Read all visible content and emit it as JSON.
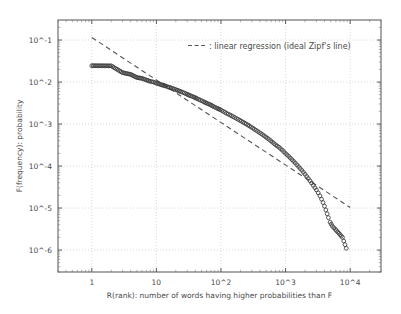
{
  "chart_data": {
    "type": "scatter",
    "title": "",
    "xlabel": "R(rank): number of words having higher probabilities than F",
    "ylabel": "F(frequency): probability",
    "xscale": "log",
    "yscale": "log",
    "xlim": [
      0.3,
      30000
    ],
    "ylim": [
      3e-07,
      0.3
    ],
    "grid": true,
    "legend_position": "top-right",
    "legend": [
      {
        "label": ": linear regression (ideal Zipf's line)",
        "style": "dashed",
        "color": "#555555"
      }
    ],
    "xticks": [
      1,
      10,
      100,
      1000,
      10000
    ],
    "xtick_labels": [
      "1",
      "10",
      "10^2",
      "10^3",
      "10^4"
    ],
    "yticks": [
      0.1,
      0.01,
      0.001,
      0.0001,
      1e-05,
      1e-06
    ],
    "ytick_labels": [
      "10^-1",
      "10^-2",
      "10^-3",
      "10^-4",
      "10^-5",
      "10^-6"
    ],
    "series": [
      {
        "name": "observed word frequencies",
        "marker": "open-circle",
        "color": "#3a3a3a",
        "points": [
          [
            1,
            0.0245
          ],
          [
            2,
            0.0243
          ],
          [
            3,
            0.0167
          ],
          [
            4,
            0.0152
          ],
          [
            5,
            0.0128
          ],
          [
            6,
            0.0122
          ],
          [
            7,
            0.0112
          ],
          [
            8,
            0.0104
          ],
          [
            9,
            0.01
          ],
          [
            10,
            0.0094
          ],
          [
            11,
            0.009
          ],
          [
            12,
            0.0086
          ],
          [
            13,
            0.0083
          ],
          [
            14,
            0.008
          ],
          [
            15,
            0.0077
          ],
          [
            17,
            0.0072
          ],
          [
            19,
            0.0068
          ],
          [
            21,
            0.0064
          ],
          [
            24,
            0.0059
          ],
          [
            27,
            0.0055
          ],
          [
            30,
            0.0051
          ],
          [
            34,
            0.0047
          ],
          [
            38,
            0.0044
          ],
          [
            43,
            0.004
          ],
          [
            48,
            0.0037
          ],
          [
            54,
            0.0034
          ],
          [
            61,
            0.0031
          ],
          [
            68,
            0.0029
          ],
          [
            77,
            0.0026
          ],
          [
            86,
            0.0024
          ],
          [
            97,
            0.0022
          ],
          [
            109,
            0.002
          ],
          [
            122,
            0.0018
          ],
          [
            137,
            0.00165
          ],
          [
            154,
            0.0015
          ],
          [
            173,
            0.00136
          ],
          [
            195,
            0.00123
          ],
          [
            219,
            0.00111
          ],
          [
            246,
            0.001
          ],
          [
            276,
            0.0009
          ],
          [
            310,
            0.0008
          ],
          [
            349,
            0.00071
          ],
          [
            392,
            0.00063
          ],
          [
            440,
            0.00056
          ],
          [
            495,
            0.00049
          ],
          [
            556,
            0.00043
          ],
          [
            625,
            0.00037
          ],
          [
            702,
            0.00032
          ],
          [
            789,
            0.00028
          ],
          [
            886,
            0.00024
          ],
          [
            996,
            0.0002
          ],
          [
            1119,
            0.00017
          ],
          [
            1257,
            0.000142
          ],
          [
            1412,
            0.000118
          ],
          [
            1587,
            9.7e-05
          ],
          [
            1783,
            7.9e-05
          ],
          [
            2003,
            6.35e-05
          ],
          [
            2250,
            5.05e-05
          ],
          [
            2528,
            3.95e-05
          ],
          [
            2840,
            3.05e-05
          ],
          [
            3000,
            2.7e-05
          ],
          [
            3200,
            2.3e-05
          ],
          [
            3400,
            1.95e-05
          ],
          [
            3600,
            1.63e-05
          ],
          [
            3800,
            1.35e-05
          ],
          [
            4000,
            1.11e-05
          ],
          [
            4200,
            9e-06
          ],
          [
            4400,
            7.3e-06
          ],
          [
            4600,
            5.9e-06
          ],
          [
            4900,
            4.6e-06
          ],
          [
            5300,
            3.7e-06
          ],
          [
            5900,
            3.1e-06
          ],
          [
            6700,
            2.5e-06
          ],
          [
            7600,
            2e-06
          ],
          [
            8700,
            1.1e-06
          ]
        ]
      }
    ],
    "regression_line": {
      "name": "linear regression (ideal Zipf's line)",
      "style": "dashed",
      "color": "#555555",
      "endpoints": [
        [
          1.0,
          0.115
        ],
        [
          10000,
          1.03e-05
        ]
      ],
      "slope": -1.0
    }
  }
}
